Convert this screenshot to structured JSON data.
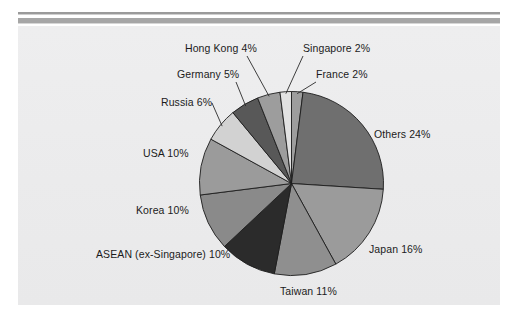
{
  "figure": {
    "background_color": "#ececed",
    "page_color": "#ffffff",
    "rule_color": "#a6a6a6"
  },
  "chart_data": {
    "type": "pie",
    "title": "",
    "subtitle": "",
    "xlabel": "",
    "ylabel": "",
    "legend_position": "none",
    "grid": false,
    "start_angle_deg": 0,
    "direction": "clockwise",
    "units": "percent",
    "total": 100,
    "categories": [
      "France",
      "Others",
      "Japan",
      "Taiwan",
      "ASEAN (ex-Singapore)",
      "Korea",
      "USA",
      "Russia",
      "Germany",
      "Hong Kong",
      "Singapore"
    ],
    "values": [
      2,
      24,
      16,
      11,
      10,
      10,
      10,
      6,
      5,
      4,
      2
    ],
    "labels": [
      "France 2%",
      "Others 24%",
      "Japan 16%",
      "Taiwan 11%",
      "ASEAN (ex-Singapore) 10%",
      "Korea 10%",
      "USA 10%",
      "Russia 6%",
      "Germany 5%",
      "Hong Kong 4%",
      "Singapore 2%"
    ],
    "colors": [
      "#9d9d9d",
      "#6f6f6f",
      "#9b9b9b",
      "#8f8f8f",
      "#2b2b2b",
      "#8a8a8a",
      "#9b9b9b",
      "#d2d2d2",
      "#585858",
      "#9d9d9d",
      "#e2e2e2"
    ],
    "slices": [
      {
        "name": "France",
        "value": 2,
        "label": "France 2%",
        "color": "#9d9d9d",
        "leader": true
      },
      {
        "name": "Others",
        "value": 24,
        "label": "Others 24%",
        "color": "#6f6f6f",
        "leader": false
      },
      {
        "name": "Japan",
        "value": 16,
        "label": "Japan 16%",
        "color": "#9b9b9b",
        "leader": false
      },
      {
        "name": "Taiwan",
        "value": 11,
        "label": "Taiwan 11%",
        "color": "#8f8f8f",
        "leader": false
      },
      {
        "name": "ASEAN (ex-Singapore)",
        "value": 10,
        "label": "ASEAN (ex-Singapore) 10%",
        "color": "#2b2b2b",
        "leader": false
      },
      {
        "name": "Korea",
        "value": 10,
        "label": "Korea 10%",
        "color": "#8a8a8a",
        "leader": false
      },
      {
        "name": "USA",
        "value": 10,
        "label": "USA 10%",
        "color": "#9b9b9b",
        "leader": false
      },
      {
        "name": "Russia",
        "value": 6,
        "label": "Russia 6%",
        "color": "#d2d2d2",
        "leader": true
      },
      {
        "name": "Germany",
        "value": 5,
        "label": "Germany 5%",
        "color": "#585858",
        "leader": true
      },
      {
        "name": "Hong Kong",
        "value": 4,
        "label": "Hong Kong 4%",
        "color": "#9d9d9d",
        "leader": true
      },
      {
        "name": "Singapore",
        "value": 2,
        "label": "Singapore 2%",
        "color": "#e2e2e2",
        "leader": true
      }
    ]
  },
  "labels": {
    "hong_kong": "Hong Kong 4%",
    "singapore": "Singapore 2%",
    "germany": "Germany 5%",
    "france": "France 2%",
    "russia": "Russia 6%",
    "others": "Others 24%",
    "usa": "USA 10%",
    "korea": "Korea 10%",
    "japan": "Japan 16%",
    "asean": "ASEAN (ex-Singapore) 10%",
    "taiwan": "Taiwan 11%"
  }
}
